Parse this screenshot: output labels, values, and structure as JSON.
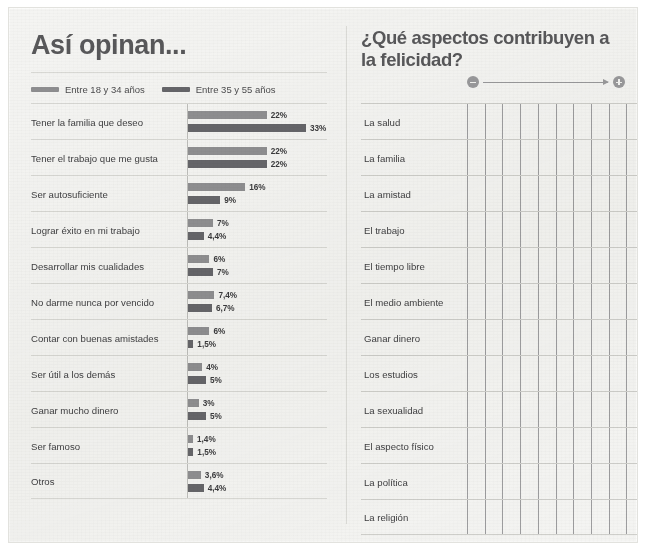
{
  "left_panel": {
    "title": "Así opinan...",
    "legend": [
      {
        "label": "Entre 18 y 34 años",
        "color": "#8f8f91"
      },
      {
        "label": "Entre 35 y 55 años",
        "color": "#66666a"
      }
    ]
  },
  "right_panel": {
    "title": "¿Qué aspectos contribuyen a la felicidad?",
    "scale": {
      "minus_icon": "minus-circle-icon",
      "plus_icon": "plus-circle-icon",
      "arrow_icon": "right-arrow-icon"
    },
    "columns": 10,
    "items": [
      "La salud",
      "La familia",
      "La amistad",
      "El trabajo",
      "El tiempo libre",
      "El medio ambiente",
      "Ganar dinero",
      "Los estudios",
      "La sexualidad",
      "El aspecto físico",
      "La política",
      "La religión"
    ]
  },
  "chart_data": {
    "type": "bar",
    "title": "Así opinan...",
    "xlabel": "",
    "ylabel": "",
    "orientation": "horizontal",
    "grid": false,
    "legend_position": "top-left",
    "xlim": [
      0,
      33
    ],
    "categories": [
      "Tener la familia que deseo",
      "Tener el trabajo que me gusta",
      "Ser autosuficiente",
      "Lograr éxito en mi trabajo",
      "Desarrollar mis cualidades",
      "No darme nunca por vencido",
      "Contar con buenas amistades",
      "Ser útil a los demás",
      "Ganar mucho dinero",
      "Ser famoso",
      "Otros"
    ],
    "series": [
      {
        "name": "Entre 18 y 34 años",
        "color": "#8f8f91",
        "values": [
          22,
          22,
          16,
          7,
          6,
          7.4,
          6,
          4,
          3,
          1.4,
          3.6
        ],
        "labels": [
          "22%",
          "22%",
          "16%",
          "7%",
          "6%",
          "7,4%",
          "6%",
          "4%",
          "3%",
          "1,4%",
          "3,6%"
        ]
      },
      {
        "name": "Entre 35 y 55 años",
        "color": "#66666a",
        "values": [
          33,
          22,
          9,
          4.4,
          7,
          6.7,
          1.5,
          5,
          5,
          1.5,
          4.4
        ],
        "labels": [
          "33%",
          "22%",
          "9%",
          "4,4%",
          "7%",
          "6,7%",
          "1,5%",
          "5%",
          "5%",
          "1,5%",
          "4,4%"
        ]
      }
    ]
  }
}
